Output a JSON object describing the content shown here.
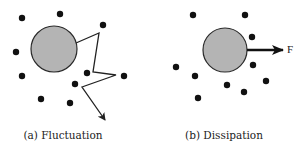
{
  "colors": {
    "background": "#ffffff",
    "large_particle_fill": "#b4b4b4",
    "large_particle_stroke": "#2a2a2a",
    "small_particle": "#111111",
    "line": "#222222"
  },
  "panels": [
    {
      "id": "a",
      "caption": "(a) Fluctuation",
      "caption_pos": {
        "x": 63,
        "y": 129
      },
      "large_particle": {
        "cx": 54,
        "cy": 49,
        "r": 23
      },
      "small_particles": [
        {
          "cx": 22,
          "cy": 18
        },
        {
          "cx": 60,
          "cy": 14
        },
        {
          "cx": 103,
          "cy": 25
        },
        {
          "cx": 16,
          "cy": 52
        },
        {
          "cx": 22,
          "cy": 76
        },
        {
          "cx": 87,
          "cy": 73
        },
        {
          "cx": 75,
          "cy": 84
        },
        {
          "cx": 124,
          "cy": 76
        },
        {
          "cx": 41,
          "cy": 99
        },
        {
          "cx": 70,
          "cy": 103
        }
      ],
      "trajectory": {
        "points": "76,43 99,33 93,72 116,75 82,87 105,120",
        "end_arrow": true
      }
    },
    {
      "id": "b",
      "caption": "(b) Dissipation",
      "caption_pos": {
        "x": 224,
        "y": 129
      },
      "large_particle": {
        "cx": 225,
        "cy": 50,
        "r": 22
      },
      "small_particles": [
        {
          "cx": 193,
          "cy": 15
        },
        {
          "cx": 245,
          "cy": 15
        },
        {
          "cx": 252,
          "cy": 37
        },
        {
          "cx": 253,
          "cy": 65
        },
        {
          "cx": 176,
          "cy": 67
        },
        {
          "cx": 195,
          "cy": 76
        },
        {
          "cx": 227,
          "cy": 85
        },
        {
          "cx": 266,
          "cy": 81
        },
        {
          "cx": 244,
          "cy": 92
        },
        {
          "cx": 198,
          "cy": 98
        }
      ],
      "force_arrow": {
        "x1": 247,
        "y1": 50,
        "x2": 283,
        "y2": 50
      },
      "force_label": "F",
      "force_label_pos": {
        "x": 287,
        "y": 43
      }
    }
  ]
}
